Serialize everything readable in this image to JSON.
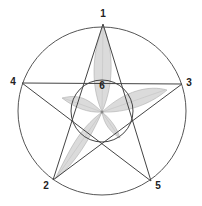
{
  "diagram": {
    "outer_circle": {
      "cx": 102,
      "cy": 111,
      "r": 84
    },
    "inner_circle": {
      "cx": 102,
      "cy": 111,
      "r": 31
    },
    "center": {
      "x": 102,
      "y": 112
    },
    "points": [
      {
        "id": "1",
        "label": "1",
        "x": 103,
        "y": 24,
        "lx": 103,
        "ly": 14
      },
      {
        "id": "2",
        "label": "2",
        "x": 53,
        "y": 180,
        "lx": 46,
        "ly": 186
      },
      {
        "id": "3",
        "label": "3",
        "x": 182,
        "y": 84,
        "lx": 189,
        "ly": 83
      },
      {
        "id": "4",
        "label": "4",
        "x": 22,
        "y": 83,
        "lx": 13,
        "ly": 82
      },
      {
        "id": "5",
        "label": "5",
        "x": 151,
        "y": 181,
        "lx": 158,
        "ly": 186
      }
    ],
    "center_label": {
      "label": "6",
      "x": 102,
      "y": 86
    },
    "star_order": [
      "1",
      "2",
      "3",
      "4",
      "5"
    ],
    "colors": {
      "line": "#444444",
      "leaf_fill": "#cccccc",
      "leaf_stroke": "#9a9a9a",
      "text": "#222222"
    }
  }
}
